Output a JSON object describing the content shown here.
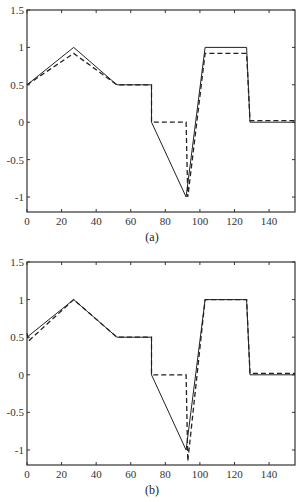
{
  "chart_data": [
    {
      "type": "line",
      "title": "",
      "caption": "(a)",
      "xlabel": "",
      "ylabel": "",
      "xlim": [
        0,
        155
      ],
      "ylim": [
        -1.2,
        1.5
      ],
      "xticks": [
        0,
        20,
        40,
        60,
        80,
        100,
        120,
        140
      ],
      "yticks": [
        1.5,
        1,
        0.5,
        0,
        -0.5,
        -1
      ],
      "ytick_labels": [
        "1.5",
        "1",
        "0.5",
        "0",
        "-0.5",
        "-1"
      ],
      "grid": false,
      "legend": null,
      "series": [
        {
          "name": "true",
          "style": "solid",
          "x": [
            0,
            27,
            52,
            72,
            72,
            92,
            103,
            127,
            129,
            155
          ],
          "y": [
            0.5,
            1.0,
            0.5,
            0.5,
            0.0,
            -1.0,
            1.0,
            1.0,
            0.0,
            0.0
          ]
        },
        {
          "name": "estimate",
          "style": "dashed",
          "x": [
            0,
            27,
            52,
            72,
            72,
            92,
            93,
            103,
            127,
            129,
            155
          ],
          "y": [
            0.5,
            0.92,
            0.5,
            0.5,
            0.0,
            0.0,
            -1.0,
            0.92,
            0.92,
            0.02,
            0.02
          ]
        }
      ]
    },
    {
      "type": "line",
      "title": "",
      "caption": "(b)",
      "xlabel": "",
      "ylabel": "",
      "xlim": [
        0,
        155
      ],
      "ylim": [
        -1.2,
        1.5
      ],
      "xticks": [
        0,
        20,
        40,
        60,
        80,
        100,
        120,
        140
      ],
      "yticks": [
        1.5,
        1,
        0.5,
        0,
        -0.5,
        -1
      ],
      "ytick_labels": [
        "1.5",
        "1",
        "0.5",
        "0",
        "-0.5",
        "-1"
      ],
      "grid": false,
      "legend": null,
      "series": [
        {
          "name": "true",
          "style": "solid",
          "x": [
            0,
            27,
            52,
            72,
            72,
            92,
            103,
            127,
            129,
            155
          ],
          "y": [
            0.5,
            1.0,
            0.5,
            0.5,
            0.0,
            -1.0,
            1.0,
            1.0,
            0.0,
            0.0
          ]
        },
        {
          "name": "estimate",
          "style": "dashed",
          "x": [
            0,
            1,
            27,
            52,
            72,
            72,
            92,
            93,
            103,
            127,
            129,
            155
          ],
          "y": [
            0.55,
            0.45,
            1.0,
            0.5,
            0.5,
            0.0,
            0.0,
            -1.15,
            1.0,
            1.0,
            0.02,
            0.02
          ]
        }
      ]
    }
  ]
}
